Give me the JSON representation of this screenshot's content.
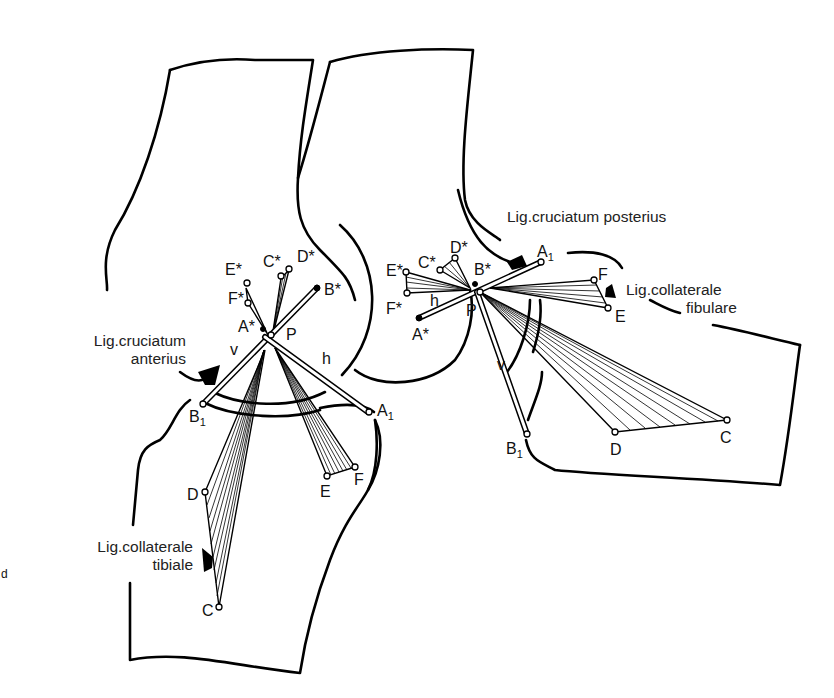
{
  "figure": {
    "left_knee": {
      "labels": {
        "lig_anterior_line1": "Lig.cruciatum",
        "lig_anterior_line2": "anterius",
        "lig_tibiale_line1": "Lig.collaterale",
        "lig_tibiale_line2": "tibiale",
        "E_star": "E*",
        "C_star": "C*",
        "D_star": "D*",
        "F_star": "F*",
        "A_star": "A*",
        "B_star": "B*",
        "P": "P",
        "v": "v",
        "h": "h",
        "B1": "B",
        "B1_sub": "1",
        "A1": "A",
        "A1_sub": "1",
        "D": "D",
        "C": "C",
        "E": "E",
        "F": "F"
      }
    },
    "right_knee": {
      "labels": {
        "lig_posterior": "Lig.cruciatum posterius",
        "lig_fibulare_line1": "Lig.collaterale",
        "lig_fibulare_line2": "fibulare",
        "E_star": "E*",
        "C_star": "C*",
        "D_star": "D*",
        "F_star": "F*",
        "A_star": "A*",
        "B_star": "B*",
        "P": "P",
        "v": "v",
        "h": "h",
        "A1": "A",
        "A1_sub": "1",
        "B1": "B",
        "B1_sub": "1",
        "F": "F",
        "E": "E",
        "D": "D",
        "C": "C"
      }
    },
    "edge_fragment": "d"
  }
}
